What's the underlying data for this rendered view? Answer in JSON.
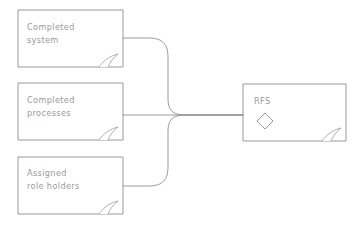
{
  "diagram": {
    "style": {
      "background": "#ffffff",
      "stroke": "#8f8f8f",
      "stroke_light": "#a8a8a8",
      "text_color": "#9a9a9a",
      "stroke_width": 0.9
    },
    "nodes": [
      {
        "id": "completed-system",
        "shape": "note",
        "label": "Completed\nsystem",
        "x": 18,
        "y": 10,
        "width": 105,
        "height": 57
      },
      {
        "id": "completed-processes",
        "shape": "note",
        "label": "Completed\nprocesses",
        "x": 18,
        "y": 83,
        "width": 105,
        "height": 57
      },
      {
        "id": "assigned-role-holders",
        "shape": "note",
        "label": "Assigned\nrole holders",
        "x": 18,
        "y": 157,
        "width": 105,
        "height": 57
      },
      {
        "id": "rfs",
        "shape": "note",
        "label": "RFS",
        "glyph": "diamond",
        "x": 243,
        "y": 84,
        "width": 103,
        "height": 57
      }
    ],
    "connectors": [
      {
        "id": "connector-system-to-rfs",
        "from": "completed-system",
        "to": "rfs",
        "kind": "s-curve-down"
      },
      {
        "id": "connector-processes-to-rfs",
        "from": "completed-processes",
        "to": "rfs",
        "kind": "straight"
      },
      {
        "id": "connector-roles-to-rfs",
        "from": "assigned-role-holders",
        "to": "rfs",
        "kind": "s-curve-up"
      }
    ]
  }
}
